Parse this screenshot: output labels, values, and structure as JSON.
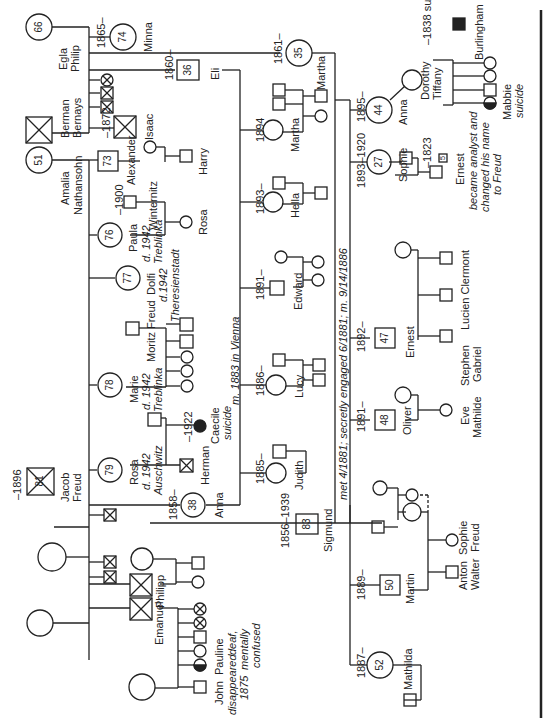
{
  "people": {
    "egla_philip": {
      "name": "Egla\nPhilip",
      "age": "66"
    },
    "minna": {
      "name": "Minna",
      "years": "1865–",
      "age": "74"
    },
    "eli": {
      "name": "Eli",
      "years": "1860–",
      "age": "36"
    },
    "martha_bernays": {
      "name": "Martha",
      "years": "1861–",
      "age": "35"
    },
    "berman_bernays": {
      "name": "Berman Bernays"
    },
    "isaac": {
      "name": "Isaac",
      "years": "–1872"
    },
    "amalia": {
      "name": "Amalia Nathansohn",
      "age": "51"
    },
    "alexander": {
      "name": "Alexander",
      "age": "73"
    },
    "harry": {
      "name": "Harry"
    },
    "winternitz": {
      "name": "Winternitz",
      "years": "–1900"
    },
    "paula": {
      "name": "Paula",
      "note1": "d. 1942",
      "note2": "Treblinka",
      "age": "76"
    },
    "rosa_w": {
      "name": "Rosa"
    },
    "dolfi": {
      "name": "Dolfi",
      "note1": "d.1942",
      "note2": "Theresienstadt",
      "age": "77"
    },
    "moritz": {
      "name": "Moritz Freud"
    },
    "marie": {
      "name": "Marie",
      "note1": "d. 1942",
      "note2": "Treblinka",
      "age": "78"
    },
    "caecile": {
      "name": "Caecile",
      "note": "suicide",
      "years": "–1922"
    },
    "herman": {
      "name": "Herman"
    },
    "rosa": {
      "name": "Rosa",
      "note1": "d. 1942",
      "note2": "Auschwitz",
      "age": "79"
    },
    "anna_f": {
      "name": "Anna",
      "years": "1858–",
      "age": "38"
    },
    "jacob": {
      "name": "Jacob Freud",
      "years": "–1896",
      "age": "81"
    },
    "philipp": {
      "name": "Philipp"
    },
    "emanuel": {
      "name": "Emanuel"
    },
    "john": {
      "name": "John",
      "note": "disappeared 1875"
    },
    "pauline": {
      "name": "Pauline",
      "note": "deaf, mentally confused"
    },
    "sigmund": {
      "name": "Sigmund",
      "years": "1856–1939",
      "age": "83"
    },
    "martha_e": {
      "name": "Martha",
      "years": "1894"
    },
    "hella": {
      "name": "Hella",
      "years": "1893–"
    },
    "edward": {
      "name": "Edward",
      "years": "1891–"
    },
    "lucy": {
      "name": "Lucy",
      "years": "1886–"
    },
    "judith": {
      "name": "Judith",
      "years": "1885–"
    },
    "anna": {
      "name": "Anna",
      "years": "1895–",
      "age": "44"
    },
    "dorothy": {
      "name": "Dorothy Tiffany"
    },
    "burlingham": {
      "name": "Burlingham",
      "note": "–1838 suicide"
    },
    "mabbie": {
      "name": "Mabbie",
      "note": "suicide"
    },
    "sophie": {
      "name": "Sophie",
      "years": "1893–1920",
      "age": "27"
    },
    "ernest_h": {
      "name": "Ernest",
      "years": "–1823",
      "age": "5",
      "note": "became analyst and changed his name to Freud"
    },
    "clermont": {
      "name": "Lucien  Clermont"
    },
    "ernest": {
      "name": "Ernest",
      "years": "1892–",
      "age": "47"
    },
    "stephen": {
      "name": "Stephen Gabriel"
    },
    "oliver": {
      "name": "Oliver",
      "years": "1891–",
      "age": "48"
    },
    "eve": {
      "name": "Eve Mathilde"
    },
    "martin": {
      "name": "Martin",
      "years": "1889–",
      "age": "50"
    },
    "sophie_f": {
      "name": "Sophie Freud"
    },
    "anton": {
      "name": "Anton Walter"
    },
    "mathilda": {
      "name": "Mathilda",
      "years": "1887–",
      "age": "52"
    }
  },
  "annotations": {
    "eli_marriage": "m. 1883 in Vienna",
    "sigmund_marriage": "met 4/1881; secretly engaged 6/1881; m. 9/14/1886"
  }
}
